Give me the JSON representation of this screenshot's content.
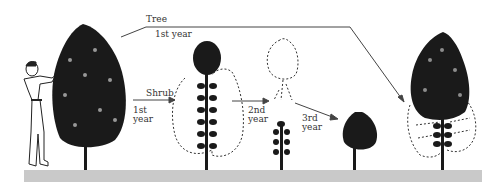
{
  "diagram": {
    "type": "pruning-illustration",
    "labels": {
      "tree": "Tree",
      "tree_year": "1st year",
      "shrub": "Shrub",
      "shrub_year_1": "1st year",
      "year_2": "2nd year",
      "year_3": "3rd year"
    },
    "colors": {
      "foliage": "#1a1a1a",
      "outline": "#333333",
      "ground": "#c9c9c9",
      "background": "#ffffff"
    },
    "stages": [
      {
        "id": "start",
        "description": "Person pruning a young full tree"
      },
      {
        "id": "shrub-1st-year",
        "description": "Tree with lower branches removed; dashed shrub outline"
      },
      {
        "id": "shrub-2nd-year",
        "description": "Cut-back stem with dashed crown outline"
      },
      {
        "id": "shrub-3rd-year",
        "description": "Compact rounded shrub"
      },
      {
        "id": "tree-1st-year",
        "description": "Tree with lower growth removed; dashed outline of former lower foliage"
      }
    ]
  }
}
